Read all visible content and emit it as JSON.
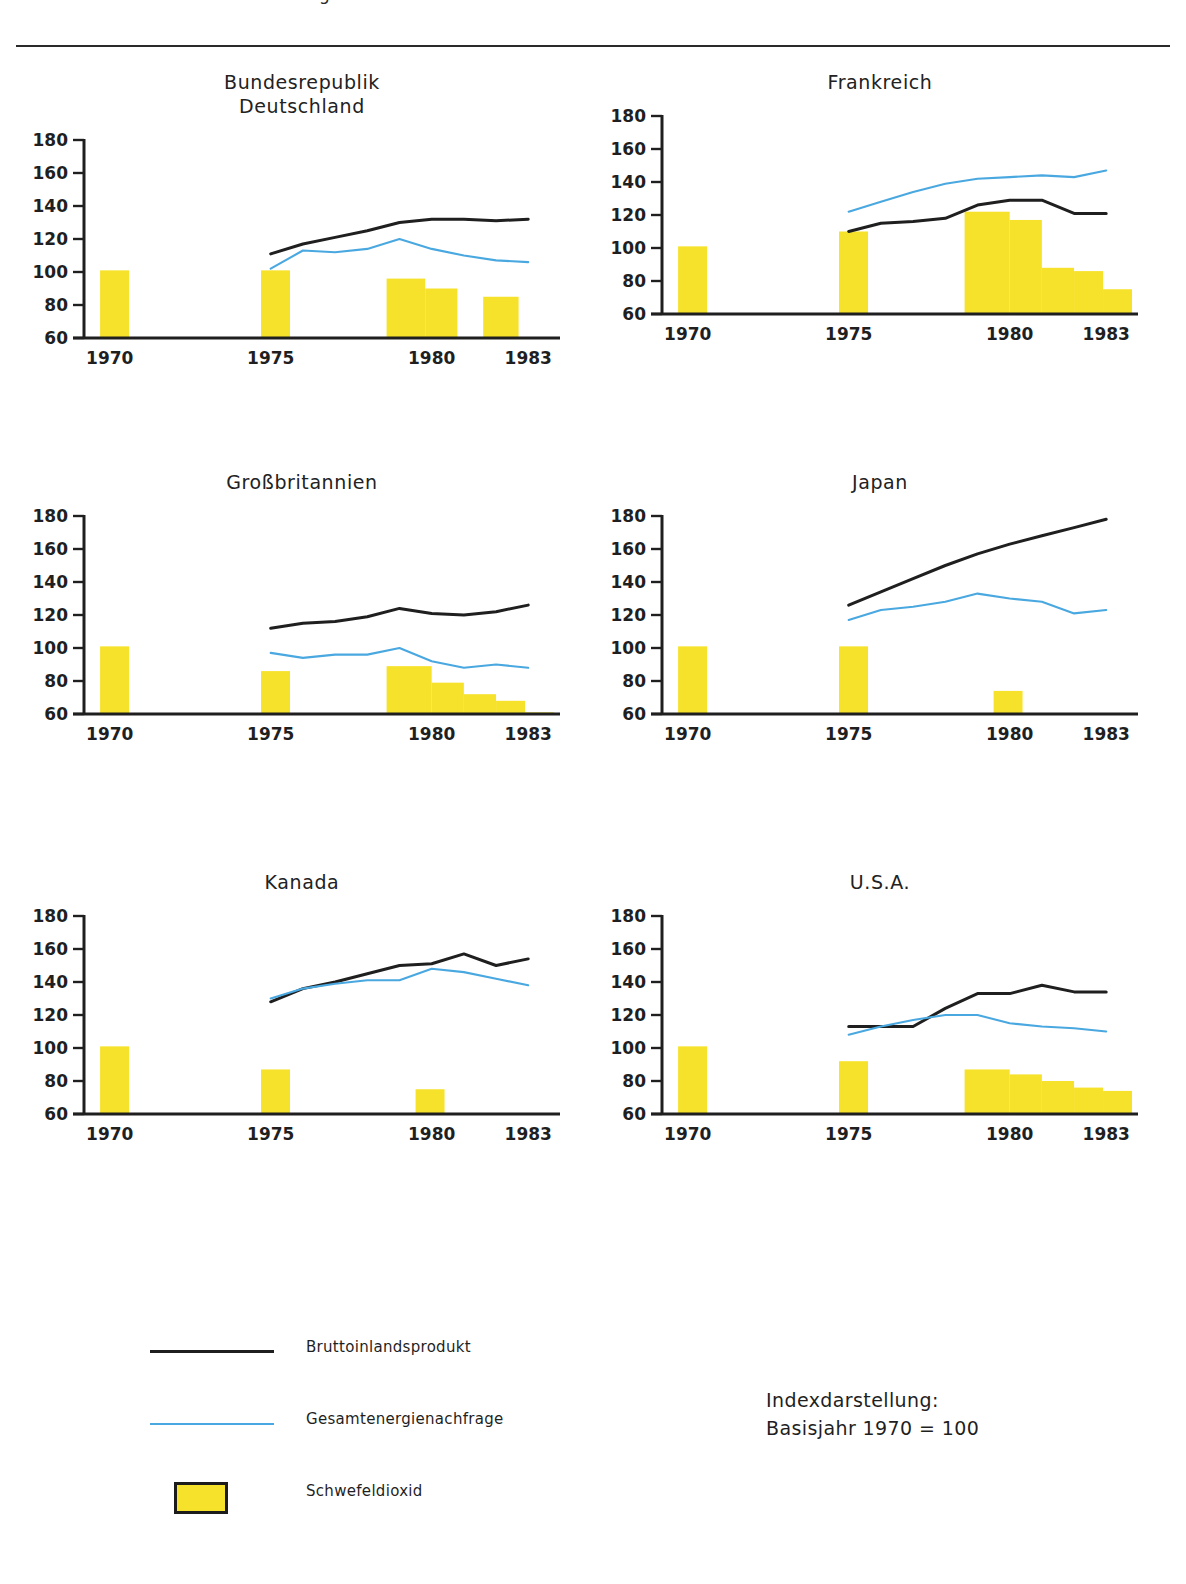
{
  "page": {
    "clipped_header": "Abbildung",
    "note": "Indexdarstellung:\nBasisjahr 1970 = 100"
  },
  "legend": {
    "items": [
      {
        "key": "line-black",
        "label": "Bruttoinlandsprodukt"
      },
      {
        "key": "line-blue",
        "label": "Gesamtenergienachfrage"
      },
      {
        "key": "swatch-yellow",
        "label": "Schwefeldioxid"
      }
    ]
  },
  "colors": {
    "gdp_line": "#1f1f1f",
    "energy_line": "#4aa8e0",
    "so2_bar": "#f7e22b",
    "bar_border": "#1c1c1c",
    "axis": "#1f1f1f"
  },
  "chart_data": [
    {
      "type": "line",
      "title": "Bundesrepublik\nDeutschland",
      "xlabel": "",
      "ylabel": "",
      "ylim": [
        60,
        180
      ],
      "yticks": [
        60,
        80,
        100,
        120,
        140,
        160,
        180
      ],
      "xlim": [
        1969.2,
        1983.8
      ],
      "xticks": [
        1970,
        1975,
        1980,
        1983
      ],
      "xticklabels": [
        "1970",
        "1975",
        "1980",
        "1983"
      ],
      "grid": false,
      "series": [
        {
          "name": "Bruttoinlandsprodukt",
          "color": "#1f1f1f",
          "x": [
            1975,
            1976,
            1977,
            1978,
            1979,
            1980,
            1981,
            1982,
            1983
          ],
          "values": [
            111,
            117,
            121,
            125,
            130,
            132,
            132,
            131,
            132
          ]
        },
        {
          "name": "Gesamtenergienachfrage",
          "color": "#4aa8e0",
          "x": [
            1975,
            1976,
            1977,
            1978,
            1979,
            1980,
            1981,
            1982,
            1983
          ],
          "values": [
            102,
            113,
            112,
            114,
            120,
            114,
            110,
            107,
            106
          ]
        }
      ],
      "bars": {
        "name": "Schwefeldioxid",
        "color": "#f7e22b",
        "items": [
          {
            "x0": 1969.7,
            "x1": 1970.6,
            "value": 101
          },
          {
            "x0": 1974.7,
            "x1": 1975.6,
            "value": 101
          },
          {
            "x0": 1978.6,
            "x1": 1979.8,
            "value": 96
          },
          {
            "x0": 1979.8,
            "x1": 1980.8,
            "value": 90
          },
          {
            "x0": 1981.6,
            "x1": 1982.7,
            "value": 85
          }
        ]
      }
    },
    {
      "type": "line",
      "title": "Frankreich",
      "xlabel": "",
      "ylabel": "",
      "ylim": [
        60,
        180
      ],
      "yticks": [
        60,
        80,
        100,
        120,
        140,
        160,
        180
      ],
      "xlim": [
        1969.2,
        1983.8
      ],
      "xticks": [
        1970,
        1975,
        1980,
        1983
      ],
      "xticklabels": [
        "1970",
        "1975",
        "1980",
        "1983"
      ],
      "grid": false,
      "series": [
        {
          "name": "Bruttoinlandsprodukt",
          "color": "#1f1f1f",
          "x": [
            1975,
            1976,
            1977,
            1978,
            1979,
            1980,
            1981,
            1982,
            1983
          ],
          "values": [
            110,
            115,
            116,
            118,
            126,
            129,
            129,
            121,
            121
          ]
        },
        {
          "name": "Gesamtenergienachfrage",
          "color": "#4aa8e0",
          "x": [
            1975,
            1976,
            1977,
            1978,
            1979,
            1980,
            1981,
            1982,
            1983
          ],
          "values": [
            122,
            128,
            134,
            139,
            142,
            143,
            144,
            143,
            147
          ]
        }
      ],
      "bars": {
        "name": "Schwefeldioxid",
        "color": "#f7e22b",
        "items": [
          {
            "x0": 1969.7,
            "x1": 1970.6,
            "value": 101
          },
          {
            "x0": 1974.7,
            "x1": 1975.6,
            "value": 110
          },
          {
            "x0": 1978.6,
            "x1": 1980.0,
            "value": 122
          },
          {
            "x0": 1980.0,
            "x1": 1981.0,
            "value": 117
          },
          {
            "x0": 1981.0,
            "x1": 1982.0,
            "value": 88
          },
          {
            "x0": 1982.0,
            "x1": 1982.9,
            "value": 86
          },
          {
            "x0": 1982.9,
            "x1": 1983.8,
            "value": 75
          }
        ]
      }
    },
    {
      "type": "line",
      "title": "Großbritannien",
      "xlabel": "",
      "ylabel": "",
      "ylim": [
        60,
        180
      ],
      "yticks": [
        60,
        80,
        100,
        120,
        140,
        160,
        180
      ],
      "xlim": [
        1969.2,
        1983.8
      ],
      "xticks": [
        1970,
        1975,
        1980,
        1983
      ],
      "xticklabels": [
        "1970",
        "1975",
        "1980",
        "1983"
      ],
      "grid": false,
      "series": [
        {
          "name": "Bruttoinlandsprodukt",
          "color": "#1f1f1f",
          "x": [
            1975,
            1976,
            1977,
            1978,
            1979,
            1980,
            1981,
            1982,
            1983
          ],
          "values": [
            112,
            115,
            116,
            119,
            124,
            121,
            120,
            122,
            126
          ]
        },
        {
          "name": "Gesamtenergienachfrage",
          "color": "#4aa8e0",
          "x": [
            1975,
            1976,
            1977,
            1978,
            1979,
            1980,
            1981,
            1982,
            1983
          ],
          "values": [
            97,
            94,
            96,
            96,
            100,
            92,
            88,
            90,
            88
          ]
        }
      ],
      "bars": {
        "name": "Schwefeldioxid",
        "color": "#f7e22b",
        "items": [
          {
            "x0": 1969.7,
            "x1": 1970.6,
            "value": 101
          },
          {
            "x0": 1974.7,
            "x1": 1975.6,
            "value": 86
          },
          {
            "x0": 1978.6,
            "x1": 1980.0,
            "value": 89
          },
          {
            "x0": 1980.0,
            "x1": 1981.0,
            "value": 79
          },
          {
            "x0": 1981.0,
            "x1": 1982.0,
            "value": 72
          },
          {
            "x0": 1982.0,
            "x1": 1982.9,
            "value": 68
          },
          {
            "x0": 1982.9,
            "x1": 1983.8,
            "value": 61
          }
        ]
      }
    },
    {
      "type": "line",
      "title": "Japan",
      "xlabel": "",
      "ylabel": "",
      "ylim": [
        60,
        180
      ],
      "yticks": [
        60,
        80,
        100,
        120,
        140,
        160,
        180
      ],
      "xlim": [
        1969.2,
        1983.8
      ],
      "xticks": [
        1970,
        1975,
        1980,
        1983
      ],
      "xticklabels": [
        "1970",
        "1975",
        "1980",
        "1983"
      ],
      "grid": false,
      "series": [
        {
          "name": "Bruttoinlandsprodukt",
          "color": "#1f1f1f",
          "x": [
            1975,
            1976,
            1977,
            1978,
            1979,
            1980,
            1981,
            1982,
            1983
          ],
          "values": [
            126,
            134,
            142,
            150,
            157,
            163,
            168,
            173,
            178
          ]
        },
        {
          "name": "Gesamtenergienachfrage",
          "color": "#4aa8e0",
          "x": [
            1975,
            1976,
            1977,
            1978,
            1979,
            1980,
            1981,
            1982,
            1983
          ],
          "values": [
            117,
            123,
            125,
            128,
            133,
            130,
            128,
            121,
            123
          ]
        }
      ],
      "bars": {
        "name": "Schwefeldioxid",
        "color": "#f7e22b",
        "items": [
          {
            "x0": 1969.7,
            "x1": 1970.6,
            "value": 101
          },
          {
            "x0": 1974.7,
            "x1": 1975.6,
            "value": 101
          },
          {
            "x0": 1979.5,
            "x1": 1980.4,
            "value": 74
          }
        ]
      }
    },
    {
      "type": "line",
      "title": "Kanada",
      "xlabel": "",
      "ylabel": "",
      "ylim": [
        60,
        180
      ],
      "yticks": [
        60,
        80,
        100,
        120,
        140,
        160,
        180
      ],
      "xlim": [
        1969.2,
        1983.8
      ],
      "xticks": [
        1970,
        1975,
        1980,
        1983
      ],
      "xticklabels": [
        "1970",
        "1975",
        "1980",
        "1983"
      ],
      "grid": false,
      "series": [
        {
          "name": "Bruttoinlandsprodukt",
          "color": "#1f1f1f",
          "x": [
            1975,
            1976,
            1977,
            1978,
            1979,
            1980,
            1981,
            1982,
            1983
          ],
          "values": [
            128,
            136,
            140,
            145,
            150,
            151,
            157,
            150,
            154
          ]
        },
        {
          "name": "Gesamtenergienachfrage",
          "color": "#4aa8e0",
          "x": [
            1975,
            1976,
            1977,
            1978,
            1979,
            1980,
            1981,
            1982,
            1983
          ],
          "values": [
            130,
            136,
            139,
            141,
            141,
            148,
            146,
            142,
            138
          ]
        }
      ],
      "bars": {
        "name": "Schwefeldioxid",
        "color": "#f7e22b",
        "items": [
          {
            "x0": 1969.7,
            "x1": 1970.6,
            "value": 101
          },
          {
            "x0": 1974.7,
            "x1": 1975.6,
            "value": 87
          },
          {
            "x0": 1979.5,
            "x1": 1980.4,
            "value": 75
          }
        ]
      }
    },
    {
      "type": "line",
      "title": "U.S.A.",
      "xlabel": "",
      "ylabel": "",
      "ylim": [
        60,
        180
      ],
      "yticks": [
        60,
        80,
        100,
        120,
        140,
        160,
        180
      ],
      "xlim": [
        1969.2,
        1983.8
      ],
      "xticks": [
        1970,
        1975,
        1980,
        1983
      ],
      "xticklabels": [
        "1970",
        "1975",
        "1980",
        "1983"
      ],
      "grid": false,
      "series": [
        {
          "name": "Bruttoinlandsprodukt",
          "color": "#1f1f1f",
          "x": [
            1975,
            1976,
            1977,
            1978,
            1979,
            1980,
            1981,
            1982,
            1983
          ],
          "values": [
            113,
            113,
            113,
            124,
            133,
            133,
            138,
            134,
            134
          ]
        },
        {
          "name": "Gesamtenergienachfrage",
          "color": "#4aa8e0",
          "x": [
            1975,
            1976,
            1977,
            1978,
            1979,
            1980,
            1981,
            1982,
            1983
          ],
          "values": [
            108,
            113,
            117,
            120,
            120,
            115,
            113,
            112,
            110
          ]
        }
      ],
      "bars": {
        "name": "Schwefeldioxid",
        "color": "#f7e22b",
        "items": [
          {
            "x0": 1969.7,
            "x1": 1970.6,
            "value": 101
          },
          {
            "x0": 1974.7,
            "x1": 1975.6,
            "value": 92
          },
          {
            "x0": 1978.6,
            "x1": 1980.0,
            "value": 87
          },
          {
            "x0": 1980.0,
            "x1": 1981.0,
            "value": 84
          },
          {
            "x0": 1981.0,
            "x1": 1982.0,
            "value": 80
          },
          {
            "x0": 1982.0,
            "x1": 1982.9,
            "value": 76
          },
          {
            "x0": 1982.9,
            "x1": 1983.8,
            "value": 74
          }
        ]
      }
    }
  ]
}
